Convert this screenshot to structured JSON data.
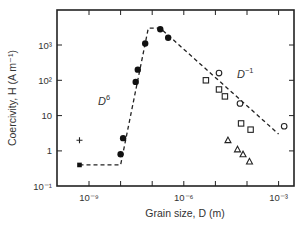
{
  "chart_data": {
    "type": "scatter",
    "title": "",
    "xlabel": "Grain size, D (m)",
    "ylabel": "Coercivity, H (A m⁻¹)",
    "xscale": "log",
    "yscale": "log",
    "xlim": [
      1e-10,
      0.003
    ],
    "ylim": [
      0.1,
      10000
    ],
    "grid": false,
    "legend": null,
    "x_ticks": [
      {
        "value": 1e-09,
        "label": "10⁻⁹"
      },
      {
        "value": 1e-06,
        "label": "10⁻⁶"
      },
      {
        "value": 0.001,
        "label": "10⁻³"
      }
    ],
    "x_minor_ticks": [
      1e-09,
      1e-08,
      1e-07,
      1e-06,
      1e-05,
      0.0001,
      0.001
    ],
    "y_ticks": [
      {
        "value": 0.1,
        "label": "10⁻¹"
      },
      {
        "value": 1,
        "label": "1"
      },
      {
        "value": 10,
        "label": "10"
      },
      {
        "value": 100,
        "label": "10²"
      },
      {
        "value": 1000,
        "label": "10³"
      }
    ],
    "annotations": [
      {
        "text": "D",
        "sup": "6",
        "x": 3e-09,
        "y": 15
      },
      {
        "text": "D",
        "sup": "−1",
        "x": 0.0002,
        "y": 15
      }
    ],
    "series": [
      {
        "name": "filled circles",
        "marker": "filled-circle",
        "points": [
          {
            "x": 1e-08,
            "y": 0.8
          },
          {
            "x": 1.2e-08,
            "y": 2.3
          },
          {
            "x": 3e-08,
            "y": 90
          },
          {
            "x": 3.5e-08,
            "y": 200
          },
          {
            "x": 6e-08,
            "y": 1100
          },
          {
            "x": 1.8e-07,
            "y": 2800
          },
          {
            "x": 3.2e-07,
            "y": 1600
          }
        ]
      },
      {
        "name": "open circles",
        "marker": "open-circle",
        "points": [
          {
            "x": 1.3e-05,
            "y": 160
          },
          {
            "x": 6e-05,
            "y": 22
          },
          {
            "x": 0.0015,
            "y": 5
          }
        ]
      },
      {
        "name": "open squares",
        "marker": "open-square",
        "points": [
          {
            "x": 5e-06,
            "y": 100
          },
          {
            "x": 1.3e-05,
            "y": 55
          },
          {
            "x": 2e-05,
            "y": 35
          },
          {
            "x": 6.5e-05,
            "y": 6
          },
          {
            "x": 0.00013,
            "y": 4
          }
        ]
      },
      {
        "name": "open triangles",
        "marker": "open-triangle",
        "points": [
          {
            "x": 2.5e-05,
            "y": 2
          },
          {
            "x": 5e-05,
            "y": 1.1
          },
          {
            "x": 7.5e-05,
            "y": 0.8
          },
          {
            "x": 0.00012,
            "y": 0.5
          }
        ]
      },
      {
        "name": "plus",
        "marker": "plus",
        "points": [
          {
            "x": 5e-10,
            "y": 2
          }
        ]
      },
      {
        "name": "filled square",
        "marker": "filled-square",
        "points": [
          {
            "x": 5e-10,
            "y": 0.4
          }
        ]
      }
    ],
    "trend_line": {
      "style": "dashed",
      "points": [
        {
          "x": 5e-10,
          "y": 0.4
        },
        {
          "x": 1e-08,
          "y": 0.4
        },
        {
          "x": 7.5e-08,
          "y": 3000
        },
        {
          "x": 1.8e-07,
          "y": 3000
        },
        {
          "x": 0.001,
          "y": 3
        }
      ]
    }
  }
}
